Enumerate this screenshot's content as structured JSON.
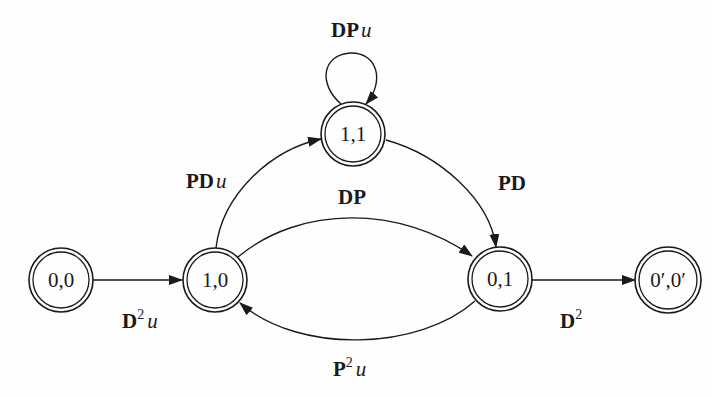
{
  "diagram": {
    "type": "state-transition-diagram",
    "nodes": [
      {
        "id": "n00",
        "label": "0,0",
        "cx": 61,
        "cy": 280
      },
      {
        "id": "n10",
        "label": "1,0",
        "cx": 215,
        "cy": 280
      },
      {
        "id": "n11",
        "label": "1,1",
        "cx": 353,
        "cy": 134
      },
      {
        "id": "n01",
        "label": "0,1",
        "cx": 500,
        "cy": 279
      },
      {
        "id": "n0p0p",
        "label": "0′,0′",
        "cx": 668,
        "cy": 280
      }
    ],
    "edges": [
      {
        "from": "0,0",
        "to": "1,0",
        "label_main": "D",
        "label_sup": "2",
        "label_var": "u"
      },
      {
        "from": "1,0",
        "to": "1,1",
        "label_main": "PD",
        "label_sup": "",
        "label_var": "u"
      },
      {
        "from": "1,1",
        "to": "1,1",
        "label_main": "DP",
        "label_sup": "",
        "label_var": "u"
      },
      {
        "from": "1,1",
        "to": "0,1",
        "label_main": "PD",
        "label_sup": "",
        "label_var": ""
      },
      {
        "from": "1,0",
        "to": "0,1",
        "label_main": "DP",
        "label_sup": "",
        "label_var": ""
      },
      {
        "from": "0,1",
        "to": "1,0",
        "label_main": "P",
        "label_sup": "2",
        "label_var": "u"
      },
      {
        "from": "0,1",
        "to": "0′,0′",
        "label_main": "D",
        "label_sup": "2",
        "label_var": ""
      }
    ],
    "colors": {
      "ink": "#1a1a1a",
      "background": "#fefefe"
    }
  }
}
